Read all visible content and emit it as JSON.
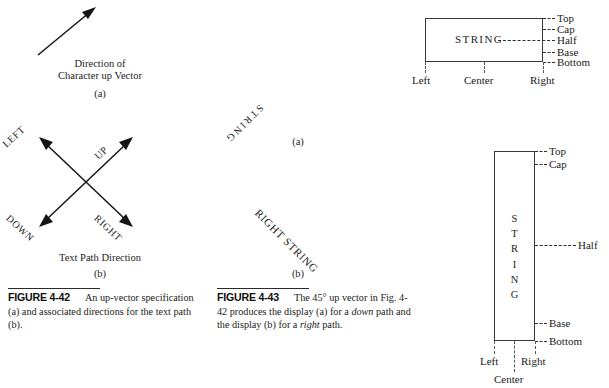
{
  "figure_4_42": {
    "panel_a": {
      "arrow_caption_line1": "Direction of",
      "arrow_caption_line2": "Character up Vector",
      "panel_label": "(a)"
    },
    "panel_b": {
      "directions": [
        {
          "name": "left",
          "label": "LEFT"
        },
        {
          "name": "up",
          "label": "UP"
        },
        {
          "name": "down",
          "label": "DOWN"
        },
        {
          "name": "right",
          "label": "RIGHT"
        }
      ],
      "caption": "Text Path Direction",
      "panel_label": "(b)"
    },
    "caption": {
      "number": "FIGURE 4-42",
      "text_1": "An up-vector",
      "text_2": "specification (a) and associated",
      "text_3": "directions for the text path (b)."
    }
  },
  "figure_4_43": {
    "panel_a": {
      "string": "STRING",
      "panel_label": "(a)"
    },
    "panel_b": {
      "string": "RIGHT STRING",
      "panel_label": "(b)"
    },
    "caption": {
      "number": "FIGURE 4-43",
      "text_1": "The 45° up",
      "text_2_pre": "vector in Fig. 4-42 produces the",
      "text_3_pre": "display (a) for a ",
      "text_3_em": "down",
      "text_3_post": " path and",
      "text_4_pre": "the display (b) for a ",
      "text_4_em": "right",
      "text_4_post": " path."
    }
  },
  "horizontal_box": {
    "string": "STRING",
    "vertical_guides": [
      {
        "name": "top",
        "label": "Top"
      },
      {
        "name": "cap",
        "label": "Cap"
      },
      {
        "name": "half",
        "label": "Half"
      },
      {
        "name": "base",
        "label": "Base"
      },
      {
        "name": "bottom",
        "label": "Bottom"
      }
    ],
    "horizontal_guides": [
      {
        "name": "left",
        "label": "Left"
      },
      {
        "name": "center",
        "label": "Center"
      },
      {
        "name": "right",
        "label": "Right"
      }
    ]
  },
  "vertical_box": {
    "string_letters": [
      "S",
      "T",
      "R",
      "I",
      "N",
      "G"
    ],
    "vertical_guides": [
      {
        "name": "top",
        "label": "Top"
      },
      {
        "name": "cap",
        "label": "Cap"
      },
      {
        "name": "half",
        "label": "Half"
      },
      {
        "name": "base",
        "label": "Base"
      },
      {
        "name": "bottom",
        "label": "Bottom"
      }
    ],
    "horizontal_guides": [
      {
        "name": "left",
        "label": "Left"
      },
      {
        "name": "right",
        "label": "Right"
      },
      {
        "name": "center",
        "label": "Center"
      }
    ]
  },
  "colors": {
    "ink": "#1a1a1a",
    "rule": "#2a2a2a",
    "box_border": "#3a3a3a",
    "dash": "#2e2e2e"
  }
}
